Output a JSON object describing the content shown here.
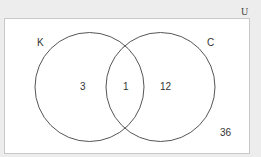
{
  "diagram": {
    "type": "venn",
    "universe_label": "U",
    "sets": [
      {
        "label": "K",
        "only_count": "3"
      },
      {
        "label": "C",
        "only_count": "12"
      }
    ],
    "intersection_count": "1",
    "outside_count": "36",
    "colors": {
      "background": "#ededed",
      "universe_fill": "#ffffff",
      "universe_stroke": "#c8c8c8",
      "circle_stroke": "#555555",
      "text": "#333333"
    }
  }
}
